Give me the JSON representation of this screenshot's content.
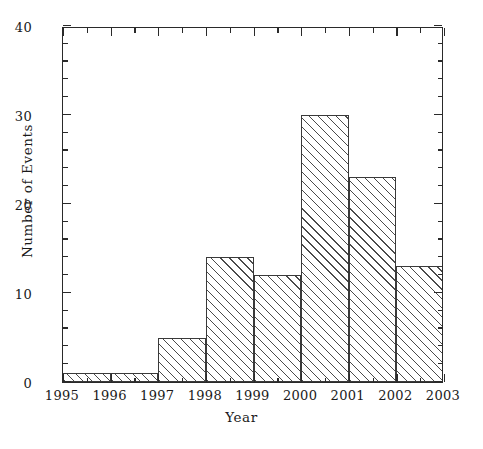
{
  "chart_data": {
    "type": "bar",
    "title": "",
    "subtitle": "",
    "xlabel": "Year",
    "ylabel": "Number of Events",
    "xlim": [
      1995,
      2003
    ],
    "ylim": [
      0,
      40
    ],
    "grid": false,
    "legend": null,
    "bin_edges": [
      1995,
      1996,
      1997,
      1998,
      1999,
      2000,
      2001,
      2002,
      2003
    ],
    "categories": [
      "1995-1996",
      "1996-1997",
      "1997-1998",
      "1998-1999",
      "1999-2000",
      "2000-2001",
      "2001-2002",
      "2002-2003"
    ],
    "values": [
      1,
      1,
      5,
      14,
      12,
      30,
      23,
      13
    ],
    "x_tick_labels": [
      "1995",
      "1996",
      "1997",
      "1998",
      "1999",
      "2000",
      "2001",
      "2002",
      "2003"
    ],
    "x_tick_values": [
      1995,
      1996,
      1997,
      1998,
      1999,
      2000,
      2001,
      2002,
      2003
    ],
    "x_minor_tick_interval": 0.5,
    "y_tick_labels": [
      "0",
      "10",
      "20",
      "30",
      "40"
    ],
    "y_tick_values": [
      0,
      10,
      20,
      30,
      40
    ],
    "y_minor_tick_interval": 2,
    "bar_fill": "hatched-diagonal",
    "colors": {
      "axis": "#2a2a2a",
      "bar_edge": "#3a3a3a",
      "bar_hatch": "#4a4a4a",
      "background": "#ffffff",
      "text": "#1a1a1a"
    }
  }
}
